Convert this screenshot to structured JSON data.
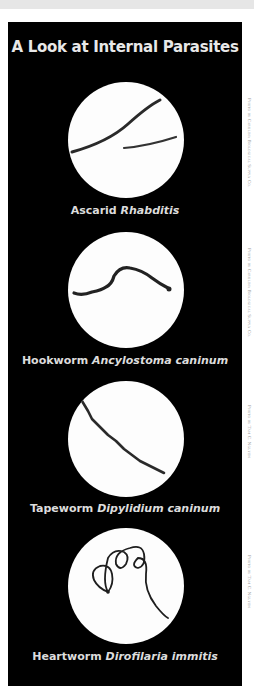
{
  "title": "A Look at Internal Parasites",
  "colors": {
    "panel": "#000000",
    "circle": "#fdfdfd",
    "text": "#dcdcdc",
    "worm": "#2a2a2a"
  },
  "specimens": [
    {
      "common": "Ascarid",
      "scientific": "Rhabditis",
      "credit": "Photo by Carolina Biological Supply Co.",
      "icon": "ascarid-worm-icon"
    },
    {
      "common": "Hookworm",
      "scientific": "Ancylostoma caninum",
      "credit": "Photo by Carolina Biological Supply Co.",
      "icon": "hookworm-icon"
    },
    {
      "common": "Tapeworm",
      "scientific": "Dipylidium caninum",
      "credit": "Photo by Tam C. Nguyen",
      "icon": "tapeworm-icon"
    },
    {
      "common": "Heartworm",
      "scientific": "Dirofilaria immitis",
      "credit": "Photo by Tam C. Nguyen",
      "icon": "heartworm-icon"
    }
  ]
}
